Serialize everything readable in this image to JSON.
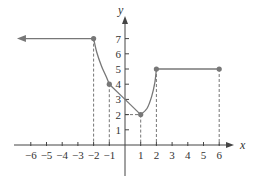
{
  "chart_data": {
    "type": "line",
    "title": "",
    "xlabel": "x",
    "ylabel": "y",
    "xlim": [
      -6.6,
      7
    ],
    "ylim": [
      -1.6,
      8
    ],
    "x_ticks": [
      -6,
      -5,
      -4,
      -3,
      -2,
      -1,
      1,
      2,
      3,
      4,
      5,
      6
    ],
    "x_tick_labels": [
      "−6",
      "−5",
      "−4",
      "−3",
      "−2",
      "−1",
      "1",
      "2",
      "3",
      "4",
      "5",
      "6"
    ],
    "y_ticks": [
      1,
      2,
      3,
      4,
      5,
      6,
      7
    ],
    "y_tick_labels": [
      "1",
      "2",
      "3",
      "4",
      "5",
      "6",
      "7"
    ],
    "grid": false,
    "line_color": "#777777",
    "point_color": "#777777",
    "series": [
      {
        "name": "ray-left",
        "kind": "ray",
        "from": [
          -2,
          7
        ],
        "direction": "left",
        "points": [
          [
            -6.5,
            7
          ],
          [
            -2,
            7
          ]
        ]
      },
      {
        "name": "curve-decreasing",
        "kind": "curve",
        "points": [
          [
            -2,
            7
          ],
          [
            -1.8,
            6.1
          ],
          [
            -1.5,
            5.2
          ],
          [
            -1.2,
            4.5
          ],
          [
            -1,
            4
          ]
        ]
      },
      {
        "name": "segment-linear",
        "kind": "segment",
        "points": [
          [
            -1,
            4
          ],
          [
            0,
            3
          ],
          [
            1,
            2
          ]
        ]
      },
      {
        "name": "curve-increasing",
        "kind": "curve",
        "points": [
          [
            1,
            2
          ],
          [
            1.4,
            2.4
          ],
          [
            1.7,
            3.2
          ],
          [
            1.9,
            4.1
          ],
          [
            2,
            5
          ]
        ]
      },
      {
        "name": "segment-constant",
        "kind": "segment",
        "points": [
          [
            2,
            5
          ],
          [
            6,
            5
          ]
        ]
      }
    ],
    "marked_points": [
      [
        -2,
        7
      ],
      [
        -1,
        4
      ],
      [
        1,
        2
      ],
      [
        2,
        5
      ],
      [
        6,
        5
      ]
    ],
    "dashed_guides": [
      {
        "x": -2,
        "y": 7
      },
      {
        "x": -1,
        "y": 4
      },
      {
        "x": 1,
        "y": 2,
        "horizontal_to_axis": true
      },
      {
        "x": 2,
        "y": 5
      },
      {
        "x": 6,
        "y": 5
      }
    ]
  }
}
